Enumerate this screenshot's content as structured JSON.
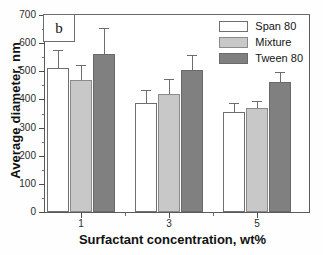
{
  "panel": {
    "label": "b"
  },
  "chart_data": {
    "type": "bar",
    "title": "",
    "subtitle": "",
    "xlabel": "Surfactant concentration, wt%",
    "ylabel": "Average diameter, nm",
    "categories": [
      "1",
      "3",
      "5"
    ],
    "ylim": [
      0,
      700
    ],
    "yticks": [
      0,
      100,
      200,
      300,
      400,
      500,
      600,
      700
    ],
    "yticklabels": [
      "0",
      "100",
      "200",
      "300",
      "400",
      "500",
      "600",
      "700"
    ],
    "yminor_step": 50,
    "grid": false,
    "legend_position": "top-right",
    "series": [
      {
        "name": "Span 80",
        "color": "#ffffff",
        "values": [
          511,
          388,
          355
        ],
        "errors": [
          66,
          47,
          32
        ]
      },
      {
        "name": "Mixture",
        "color": "#c8c8c8",
        "values": [
          468,
          420,
          368
        ],
        "errors": [
          56,
          54,
          27
        ]
      },
      {
        "name": "Tween 80",
        "color": "#808080",
        "values": [
          562,
          505,
          462
        ],
        "errors": [
          91,
          52,
          34
        ]
      }
    ]
  }
}
